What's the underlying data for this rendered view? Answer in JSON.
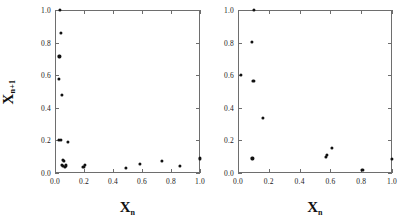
{
  "figure": {
    "width": 403,
    "height": 222,
    "background": "#ffffff",
    "point_color": "#111111",
    "axis_color": "#6e6e6e",
    "text_color": "#1a1a1a"
  },
  "axis_titles": {
    "x_base": "X",
    "x_sub": "n",
    "y_base": "X",
    "y_sub": "n+1"
  },
  "chart_data": [
    {
      "type": "scatter",
      "panel": "left",
      "title": "",
      "xlabel": "X n",
      "ylabel": "X n+1",
      "xlim": [
        0.0,
        1.0
      ],
      "ylim": [
        0.0,
        1.0
      ],
      "grid": false,
      "legend": null,
      "xticks": [
        0.0,
        0.2,
        0.4,
        0.6,
        0.8,
        1.0
      ],
      "yticks": [
        0.0,
        0.2,
        0.4,
        0.6,
        0.8,
        1.0
      ],
      "xticklabels": [
        "0.0",
        "0.2",
        "0.4",
        "0.6",
        "0.8",
        "1.0"
      ],
      "yticklabels": [
        "0.0",
        "0.2",
        "0.4",
        "0.6",
        "0.8",
        "1.0"
      ],
      "points": [
        [
          0.035,
          1.0
        ],
        [
          0.042,
          0.858
        ],
        [
          0.03,
          0.715
        ],
        [
          0.028,
          0.578
        ],
        [
          0.048,
          0.478
        ],
        [
          0.027,
          0.205
        ],
        [
          0.038,
          0.203
        ],
        [
          0.09,
          0.192
        ],
        [
          0.055,
          0.082
        ],
        [
          0.063,
          0.073
        ],
        [
          0.047,
          0.05
        ],
        [
          0.055,
          0.042
        ],
        [
          0.068,
          0.038
        ],
        [
          0.075,
          0.047
        ],
        [
          0.196,
          0.036
        ],
        [
          0.205,
          0.048
        ],
        [
          0.487,
          0.03
        ],
        [
          0.585,
          0.057
        ],
        [
          0.735,
          0.072
        ],
        [
          0.862,
          0.045
        ],
        [
          1.0,
          0.09
        ]
      ]
    },
    {
      "type": "scatter",
      "panel": "right",
      "title": "",
      "xlabel": "X n",
      "ylabel": "",
      "xlim": [
        0.0,
        1.0
      ],
      "ylim": [
        0.0,
        1.0
      ],
      "grid": false,
      "legend": null,
      "xticks": [
        0.0,
        0.2,
        0.4,
        0.6,
        0.8,
        1.0
      ],
      "yticks": [
        0.0,
        0.2,
        0.4,
        0.6,
        0.8,
        1.0
      ],
      "xticklabels": [
        "0.0",
        "0.2",
        "0.4",
        "0.6",
        "0.8",
        "1.0"
      ],
      "yticklabels": [
        "0.0",
        "0.2",
        "0.4",
        "0.6",
        "0.8",
        "1.0"
      ],
      "points": [
        [
          0.105,
          1.0
        ],
        [
          0.09,
          0.805
        ],
        [
          0.02,
          0.602
        ],
        [
          0.1,
          0.565
        ],
        [
          0.16,
          0.34
        ],
        [
          0.61,
          0.153
        ],
        [
          0.575,
          0.113
        ],
        [
          0.572,
          0.098
        ],
        [
          0.093,
          0.09
        ],
        [
          0.808,
          0.018
        ],
        [
          1.0,
          0.085
        ]
      ]
    }
  ]
}
